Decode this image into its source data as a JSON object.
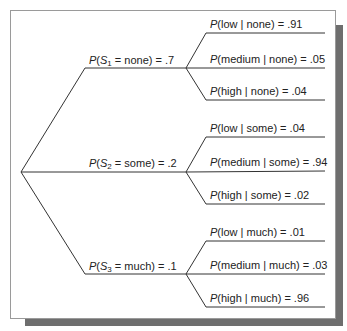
{
  "diagram": {
    "type": "probability-tree",
    "root": {
      "x": 21,
      "y": 172
    },
    "stages": [
      {
        "id": "S1",
        "var": "S",
        "sub": "1",
        "value": "none",
        "prob": ".7",
        "label_tail": " = none) = .7",
        "node": {
          "x": 186,
          "y": 68
        },
        "line_start_x": 85,
        "leaves": [
          {
            "cond": "low",
            "given": "none",
            "prob": ".91",
            "label_tail": "(low | none) = .91",
            "y": 33
          },
          {
            "cond": "medium",
            "given": "none",
            "prob": ".05",
            "label_tail": "(medium | none) = .05",
            "y": 68
          },
          {
            "cond": "high",
            "given": "none",
            "prob": ".04",
            "label_tail": "(high | none) = .04",
            "y": 100
          }
        ]
      },
      {
        "id": "S2",
        "var": "S",
        "sub": "2",
        "value": "some",
        "prob": ".2",
        "label_tail": " = some) = .2",
        "node": {
          "x": 186,
          "y": 172
        },
        "line_start_x": 21,
        "leaves": [
          {
            "cond": "low",
            "given": "some",
            "prob": ".04",
            "label_tail": "(low | some) = .04",
            "y": 137
          },
          {
            "cond": "medium",
            "given": "some",
            "prob": ".94",
            "label_tail": "(medium | some) = .94",
            "y": 171
          },
          {
            "cond": "high",
            "given": "some",
            "prob": ".02",
            "label_tail": "(high | some) = .02",
            "y": 204
          }
        ]
      },
      {
        "id": "S3",
        "var": "S",
        "sub": "3",
        "value": "much",
        "prob": ".1",
        "label_tail": " = much) = .1",
        "node": {
          "x": 186,
          "y": 274
        },
        "line_start_x": 85,
        "leaves": [
          {
            "cond": "low",
            "given": "much",
            "prob": ".01",
            "label_tail": "(low | much) = .01",
            "y": 241
          },
          {
            "cond": "medium",
            "given": "much",
            "prob": ".03",
            "label_tail": "(medium | much) = .03",
            "y": 274
          },
          {
            "cond": "high",
            "given": "much",
            "prob": ".96",
            "label_tail": "(high | much) = .96",
            "y": 307
          }
        ]
      }
    ],
    "P": "P",
    "paren_open": "(",
    "colors": {
      "line": "#333333",
      "frame_border": "#9a9a9a",
      "shadow": "#6e6e6e",
      "text": "#222222"
    }
  }
}
